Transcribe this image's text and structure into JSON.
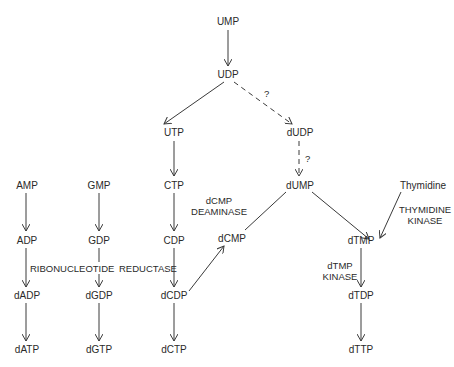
{
  "diagram": {
    "type": "metabolic-pathway",
    "nodes": {
      "ump": "UMP",
      "udp": "UDP",
      "utp": "UTP",
      "dudp": "dUDP",
      "ctp": "CTP",
      "dump": "dUMP",
      "amp": "AMP",
      "gmp": "GMP",
      "adp": "ADP",
      "gdp": "GDP",
      "cdp": "CDP",
      "dcmp": "dCMP",
      "dadp": "dADP",
      "dgdp": "dGDP",
      "dcdp": "dCDP",
      "datp": "dATP",
      "dgtp": "dGTP",
      "dctp": "dCTP",
      "dtmp": "dTMP",
      "dtdp": "dTDP",
      "dttp": "dTTP",
      "thymidine": "Thymidine"
    },
    "enzymes": {
      "ribonucleotide_reductase_1": "RIBONUCLEOTIDE",
      "ribonucleotide_reductase_2": "REDUCTASE",
      "dcmp_deaminase_1": "dCMP",
      "dcmp_deaminase_2": "DEAMINASE",
      "thymidine_kinase_1": "THYMIDINE",
      "thymidine_kinase_2": "KINASE",
      "dtmp_kinase_1": "dTMP",
      "dtmp_kinase_2": "KINASE"
    },
    "uncertain_marks": {
      "udp_to_dudp": "?",
      "dudp_to_dump": "?"
    },
    "edges": [
      {
        "from": "UMP",
        "to": "UDP",
        "style": "solid"
      },
      {
        "from": "UDP",
        "to": "UTP",
        "style": "solid"
      },
      {
        "from": "UDP",
        "to": "dUDP",
        "style": "dashed",
        "mark": "?"
      },
      {
        "from": "UTP",
        "to": "CTP",
        "style": "solid"
      },
      {
        "from": "dUDP",
        "to": "dUMP",
        "style": "dashed",
        "mark": "?"
      },
      {
        "from": "CTP",
        "to": "CDP",
        "style": "solid"
      },
      {
        "from": "AMP",
        "to": "ADP",
        "style": "solid"
      },
      {
        "from": "GMP",
        "to": "GDP",
        "style": "solid"
      },
      {
        "from": "ADP",
        "to": "dADP",
        "style": "solid",
        "enzyme": "RIBONUCLEOTIDE REDUCTASE"
      },
      {
        "from": "GDP",
        "to": "dGDP",
        "style": "solid",
        "enzyme": "RIBONUCLEOTIDE REDUCTASE"
      },
      {
        "from": "CDP",
        "to": "dCDP",
        "style": "solid",
        "enzyme": "RIBONUCLEOTIDE REDUCTASE"
      },
      {
        "from": "dADP",
        "to": "dATP",
        "style": "solid"
      },
      {
        "from": "dGDP",
        "to": "dGTP",
        "style": "solid"
      },
      {
        "from": "dCDP",
        "to": "dCTP",
        "style": "solid"
      },
      {
        "from": "dCDP",
        "to": "dCMP",
        "style": "solid"
      },
      {
        "from": "dCMP",
        "to": "dUMP",
        "style": "solid",
        "enzyme": "dCMP DEAMINASE",
        "arrowhead": false
      },
      {
        "from": "dUMP",
        "to": "dTMP",
        "style": "solid"
      },
      {
        "from": "Thymidine",
        "to": "dTMP",
        "style": "solid",
        "enzyme": "THYMIDINE KINASE"
      },
      {
        "from": "dTMP",
        "to": "dTDP",
        "style": "solid",
        "enzyme": "dTMP KINASE"
      },
      {
        "from": "dTDP",
        "to": "dTTP",
        "style": "solid"
      }
    ]
  }
}
